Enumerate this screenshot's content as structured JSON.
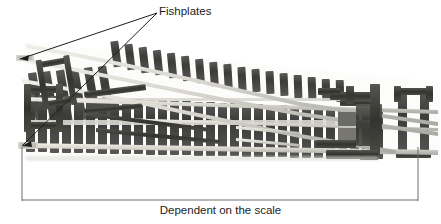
{
  "figure": {
    "kind": "photograph-diagram",
    "background_color": "#ffffff",
    "ink_color": "#1d1d1d",
    "rail_color": "#c9c9c4",
    "rail_highlight_color": "#eceae4",
    "sleeper_color": "#4a4a48",
    "sleeper_dark_color": "#2e2e2d",
    "metal_color": "#3c3c3a",
    "ballast_color": "#b8b8b2"
  },
  "annotations": {
    "fishplates": {
      "label": "Fishplates",
      "leader_count": 2,
      "anchor": {
        "x": 157,
        "y": 13
      },
      "targets": [
        {
          "x": 20,
          "y": 59
        },
        {
          "x": 22,
          "y": 146
        }
      ]
    }
  },
  "dimension": {
    "caption": "Dependent on the scale",
    "line_y": 200,
    "left_x": 22,
    "right_x": 418,
    "extension_top_y": 147
  },
  "track": {
    "main_route": "straight through, left to right",
    "diverging_route": "curves up and to the left",
    "sleeper_count_main": 34,
    "sleeper_count_diverging": 22
  }
}
